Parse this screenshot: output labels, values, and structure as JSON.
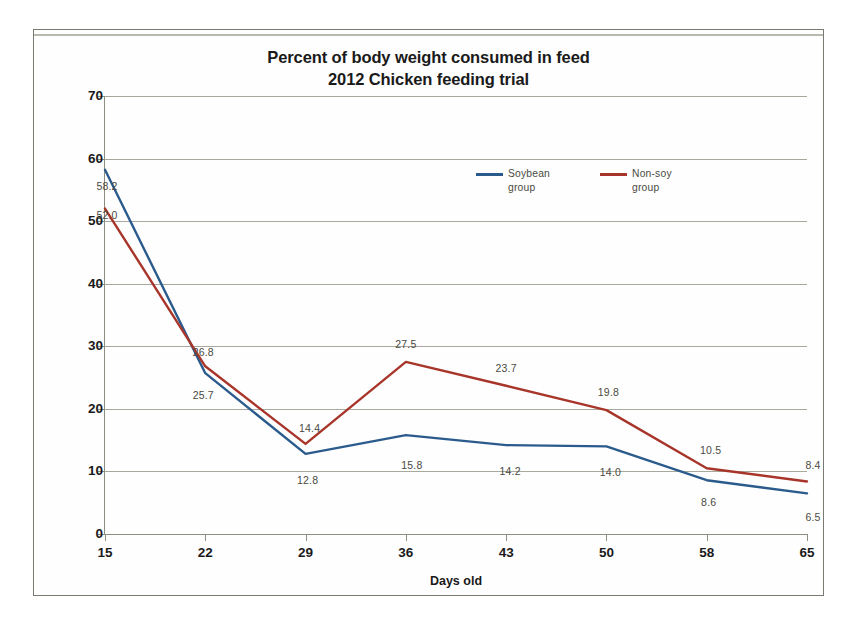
{
  "chart_data": {
    "type": "line",
    "title": "Percent of body weight consumed in feed",
    "subtitle": "2012 Chicken feeding trial",
    "xlabel": "Days old",
    "ylabel": "Body weight consumed in feed (%)",
    "categories": [
      "15",
      "22",
      "29",
      "36",
      "43",
      "50",
      "58",
      "65"
    ],
    "ylim": [
      0,
      70
    ],
    "ytick_step": 10,
    "yticks": [
      "70",
      "60",
      "50",
      "40",
      "30",
      "20",
      "10",
      "0"
    ],
    "grid": "horizontal",
    "legend_position": "inside-top-right",
    "series": [
      {
        "name": "Soybean group",
        "legend_line1": "Soybean",
        "legend_line2": "group",
        "color": "#2B5B8C",
        "values": [
          58.2,
          25.7,
          12.8,
          15.8,
          14.2,
          14.0,
          8.6,
          6.5
        ],
        "labels": [
          "58.2",
          "25.7",
          "12.8",
          "15.8",
          "14.2",
          "14.0",
          "8.6",
          "6.5"
        ]
      },
      {
        "name": "Non-soy group",
        "legend_line1": "Non-soy",
        "legend_line2": "group",
        "color": "#A8352A",
        "values": [
          52.0,
          26.8,
          14.4,
          27.5,
          23.7,
          19.8,
          10.5,
          8.4
        ],
        "labels": [
          "52.0",
          "26.8",
          "14.4",
          "27.5",
          "23.7",
          "19.8",
          "10.5",
          "8.4"
        ]
      }
    ]
  }
}
